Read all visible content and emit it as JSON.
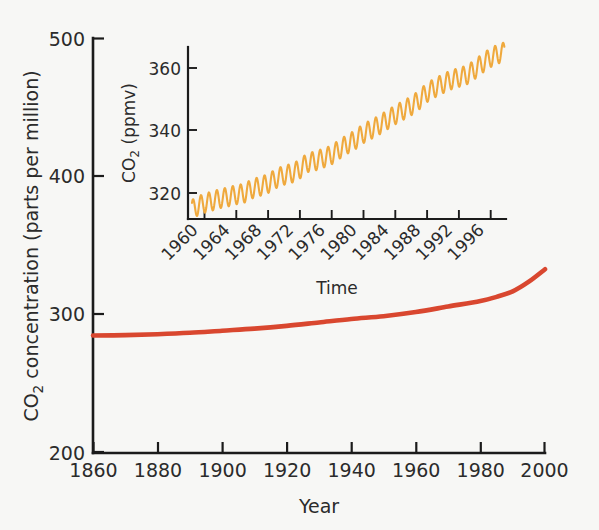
{
  "chart_data": [
    {
      "id": "main",
      "type": "line",
      "title": "",
      "xlabel": "Year",
      "ylabel": "CO2 concentration (parts per million)",
      "ylabel_display": "CO₂ concentration (parts per million)",
      "xlim": [
        1860,
        2000
      ],
      "ylim": [
        200,
        500
      ],
      "xticks": [
        1860,
        1880,
        1900,
        1920,
        1940,
        1960,
        1980,
        2000
      ],
      "yticks": [
        200,
        300,
        400,
        500
      ],
      "xticklabels": [
        "1860",
        "1880",
        "1900",
        "1920",
        "1940",
        "1960",
        "1980",
        "2000"
      ],
      "yticklabels": [
        "200",
        "300",
        "400",
        "500"
      ],
      "grid": false,
      "legend": "none",
      "series": [
        {
          "name": "Atmospheric CO2 concentration",
          "color": "#d9472f",
          "x": [
            1860,
            1870,
            1880,
            1890,
            1900,
            1910,
            1920,
            1930,
            1940,
            1950,
            1960,
            1970,
            1980,
            1985,
            1990,
            1995,
            2000
          ],
          "values": [
            285,
            285.3,
            286,
            287,
            288.5,
            290,
            292,
            294.5,
            297,
            299,
            302,
            306,
            310,
            313,
            317,
            324,
            333
          ]
        }
      ]
    },
    {
      "id": "inset",
      "type": "line",
      "title": "",
      "xlabel": "Time",
      "ylabel": "CO2 (ppmv)",
      "ylabel_display": "CO₂ (ppmv)",
      "xlim": [
        1958,
        1998
      ],
      "ylim": [
        312,
        366
      ],
      "xticks": [
        1960,
        1964,
        1968,
        1972,
        1976,
        1980,
        1984,
        1988,
        1992,
        1996
      ],
      "yticks": [
        320,
        340,
        360
      ],
      "xticklabels": [
        "1960",
        "1964",
        "1968",
        "1972",
        "1976",
        "1980",
        "1984",
        "1988",
        "1992",
        "1996"
      ],
      "yticklabels": [
        "320",
        "340",
        "360"
      ],
      "xticklabel_rotation": -45,
      "grid": false,
      "legend": "none",
      "series": [
        {
          "name": "Mauna Loa monthly mean CO2 (Keeling curve)",
          "color": "#efa93d",
          "seasonal_amplitude_ppmv": 3.0,
          "x": [
            1958.5,
            1959,
            1960,
            1961,
            1962,
            1963,
            1964,
            1965,
            1966,
            1967,
            1968,
            1969,
            1970,
            1971,
            1972,
            1973,
            1974,
            1975,
            1976,
            1977,
            1978,
            1979,
            1980,
            1981,
            1982,
            1983,
            1984,
            1985,
            1986,
            1987,
            1988,
            1989,
            1990,
            1991,
            1992,
            1993,
            1994,
            1995,
            1996,
            1997,
            1997.8
          ],
          "values": [
            315.0,
            315.8,
            316.9,
            317.6,
            318.4,
            318.9,
            319.6,
            320.0,
            321.4,
            322.2,
            323.0,
            324.6,
            325.7,
            326.3,
            327.5,
            329.7,
            330.2,
            331.1,
            332.0,
            333.8,
            335.4,
            336.8,
            338.7,
            340.1,
            341.4,
            343.0,
            344.6,
            346.0,
            347.4,
            349.2,
            351.6,
            353.1,
            354.4,
            355.6,
            356.4,
            357.1,
            358.8,
            360.8,
            362.6,
            363.8,
            364.5
          ]
        }
      ]
    }
  ],
  "main": {
    "ylabel_parts": {
      "pre": "CO",
      "sub": "2",
      "post": " concentration (parts per million)"
    },
    "xlabel": "Year",
    "yticklabels": [
      "500",
      "400",
      "300",
      "200"
    ],
    "xticklabels": [
      "1860",
      "1880",
      "1900",
      "1920",
      "1940",
      "1960",
      "1980",
      "2000"
    ]
  },
  "inset": {
    "ylabel_parts": {
      "pre": "CO",
      "sub": "2",
      "post": " (ppmv)"
    },
    "xlabel": "Time",
    "yticklabels": [
      "360",
      "340",
      "320"
    ],
    "xticklabels": [
      "1960",
      "1964",
      "1968",
      "1972",
      "1976",
      "1980",
      "1984",
      "1988",
      "1992",
      "1996"
    ]
  },
  "colors": {
    "main_curve": "#d9472f",
    "inset_curve": "#efa93d",
    "axis": "#1b1b1b",
    "text": "#2b2b2b",
    "background": "#f7f7f5"
  }
}
